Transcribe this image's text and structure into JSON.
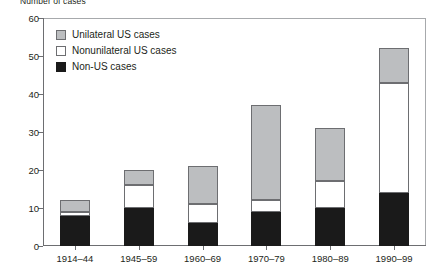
{
  "chart_data": {
    "type": "bar",
    "subtype": "stacked",
    "title": "Number of cases",
    "xlabel": "",
    "ylabel": "Number of cases",
    "categories": [
      "1914–44",
      "1945–59",
      "1960–69",
      "1970–79",
      "1980–89",
      "1990–99"
    ],
    "series": [
      {
        "name": "Non-US cases",
        "values": [
          8,
          10,
          6,
          9,
          10,
          14
        ],
        "color": "#1a1a1a"
      },
      {
        "name": "Nonunilateral US cases",
        "values": [
          1,
          6,
          5,
          3,
          7,
          29
        ],
        "color": "#ffffff"
      },
      {
        "name": "Unilateral US cases",
        "values": [
          3,
          4,
          10,
          25,
          14,
          9
        ],
        "color": "#bcbec0"
      }
    ],
    "totals": [
      12,
      20,
      21,
      37,
      31,
      52
    ],
    "ylim": [
      0,
      60
    ],
    "yticks": [
      0,
      10,
      20,
      30,
      40,
      50,
      60
    ],
    "ytick_labels": [
      "0",
      "10",
      "20",
      "30",
      "40",
      "50",
      "60"
    ],
    "grid": false,
    "legend_position": "upper-left-inside"
  },
  "legend": {
    "items": [
      {
        "label": "Unilateral US cases",
        "swatch": "gray-swatch-icon"
      },
      {
        "label": "Nonunilateral US cases",
        "swatch": "white-swatch-icon"
      },
      {
        "label": "Non-US cases",
        "swatch": "black-swatch-icon"
      }
    ]
  }
}
